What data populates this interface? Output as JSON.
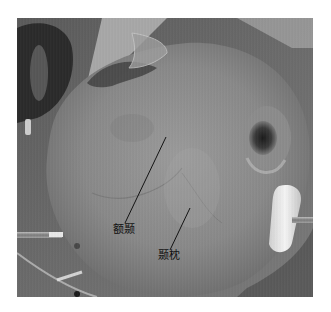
{
  "figure": {
    "annotations": [
      {
        "id": "frontotemporal",
        "label": "额颞",
        "line": {
          "x1": 149,
          "y1": 119,
          "x2": 108,
          "y2": 205
        }
      },
      {
        "id": "temporo-occipital",
        "label": "颞枕",
        "line": {
          "x1": 173,
          "y1": 190,
          "x2": 153,
          "y2": 232
        }
      }
    ],
    "colors": {
      "background": "#ffffff",
      "scalp": "#8a8a8a",
      "annotation": "#111111"
    }
  }
}
